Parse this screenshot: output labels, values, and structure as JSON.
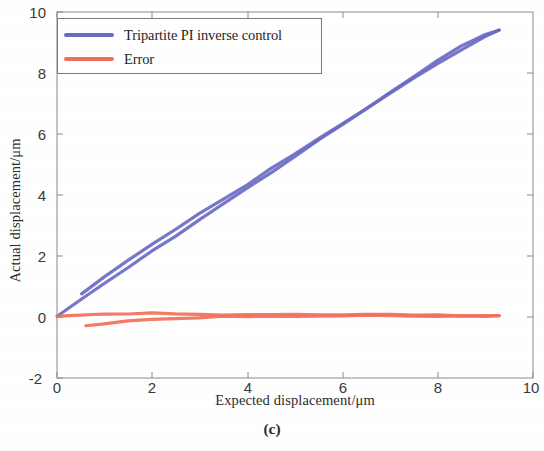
{
  "figure": {
    "caption": "(c)",
    "background": "#ffffff"
  },
  "legend": {
    "position": "top-left-inside",
    "entries": [
      {
        "label": "Tripartite PI inverse control",
        "color": "#6b6bc4"
      },
      {
        "label": "Error",
        "color": "#f2705a"
      }
    ]
  },
  "axes": {
    "xlabel": "Expected displacement/μm",
    "ylabel": "Actual displacement/μm",
    "xticks": [
      "0",
      "2",
      "4",
      "6",
      "8",
      "10"
    ],
    "yticks": [
      "10",
      "8",
      "6",
      "4",
      "2",
      "0",
      "-2"
    ],
    "xlim": [
      0,
      10
    ],
    "ylim": [
      -2,
      10
    ],
    "grid": false
  },
  "chart_data": {
    "type": "line",
    "title": "",
    "subtitle": "(c)",
    "xlabel": "Expected displacement/μm",
    "ylabel": "Actual displacement/μm",
    "xlim": [
      0,
      10
    ],
    "ylim": [
      -2,
      10
    ],
    "xticks": [
      0,
      2,
      4,
      6,
      8,
      10
    ],
    "yticks": [
      -2,
      0,
      2,
      4,
      6,
      8,
      10
    ],
    "grid": false,
    "legend_position": "upper left",
    "series": [
      {
        "name": "Tripartite PI inverse control",
        "color": "#6b6bc4",
        "branch": "ascending",
        "x": [
          0.0,
          0.5,
          1.0,
          1.5,
          2.0,
          2.5,
          3.0,
          3.5,
          4.0,
          4.5,
          5.0,
          5.5,
          6.0,
          6.5,
          7.0,
          7.5,
          8.0,
          8.5,
          9.0,
          9.3
        ],
        "y": [
          0.02,
          0.55,
          1.08,
          1.63,
          2.16,
          2.68,
          3.2,
          3.72,
          4.24,
          4.76,
          5.28,
          5.8,
          6.32,
          6.84,
          7.36,
          7.88,
          8.38,
          8.88,
          9.28,
          9.42
        ]
      },
      {
        "name": "Tripartite PI inverse control",
        "color": "#6b6bc4",
        "branch": "descending",
        "x": [
          9.3,
          9.0,
          8.5,
          8.0,
          7.5,
          7.0,
          6.5,
          6.0,
          5.5,
          5.0,
          4.5,
          4.0,
          3.5,
          3.0,
          2.5,
          2.0,
          1.5,
          1.0,
          0.5
        ],
        "y": [
          9.42,
          9.2,
          8.78,
          8.32,
          7.84,
          7.34,
          6.84,
          6.34,
          5.84,
          5.34,
          4.86,
          4.36,
          3.88,
          3.4,
          2.9,
          2.4,
          1.88,
          1.34,
          0.78
        ]
      },
      {
        "name": "Error",
        "color": "#f2705a",
        "branch": "ascending",
        "x": [
          0.0,
          0.25,
          0.5,
          0.75,
          1.0,
          1.5,
          2.0,
          2.5,
          3.0,
          3.5,
          4.0,
          4.5,
          5.0,
          5.5,
          6.0,
          6.5,
          7.0,
          7.5,
          8.0,
          8.5,
          9.0,
          9.3
        ],
        "y": [
          0.0,
          0.03,
          0.05,
          0.07,
          0.09,
          0.12,
          0.14,
          0.12,
          0.1,
          0.09,
          0.09,
          0.08,
          0.08,
          0.07,
          0.07,
          0.08,
          0.07,
          0.06,
          0.06,
          0.06,
          0.05,
          0.05
        ]
      },
      {
        "name": "Error",
        "color": "#f2705a",
        "branch": "descending",
        "x": [
          9.3,
          9.0,
          8.5,
          8.0,
          7.5,
          7.0,
          6.5,
          6.0,
          5.5,
          5.0,
          4.5,
          4.0,
          3.5,
          3.0,
          2.5,
          2.0,
          1.5,
          1.0,
          0.6
        ],
        "y": [
          0.05,
          0.04,
          0.04,
          0.03,
          0.04,
          0.03,
          0.03,
          0.03,
          0.02,
          0.02,
          0.01,
          0.01,
          0.0,
          -0.01,
          -0.03,
          -0.06,
          -0.12,
          -0.2,
          -0.28
        ]
      }
    ]
  }
}
